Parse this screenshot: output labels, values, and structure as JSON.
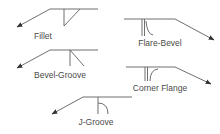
{
  "diagram": {
    "colors": {
      "line": "#6f6f6f",
      "text": "#4a4a4a",
      "arrowhead": "#333333",
      "background": "#ffffff"
    },
    "symbols": [
      {
        "id": "fillet",
        "label": "Fillet",
        "arrow_direction": "left"
      },
      {
        "id": "flare-bevel",
        "label": "Flare-Bevel",
        "arrow_direction": "right"
      },
      {
        "id": "bevel-groove",
        "label": "Bevel-Groove",
        "arrow_direction": "left"
      },
      {
        "id": "corner-flange",
        "label": "Corner Flange",
        "arrow_direction": "right"
      },
      {
        "id": "j-groove",
        "label": "J-Groove",
        "arrow_direction": "left"
      }
    ]
  }
}
